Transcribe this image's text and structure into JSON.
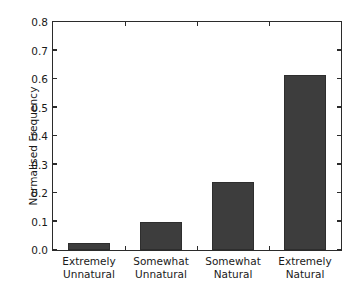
{
  "chart_data": {
    "type": "bar",
    "title": "",
    "xlabel": "",
    "ylabel": "Normalised Frequency",
    "categories": [
      "Extremely\nUnnatural",
      "Somewhat\nUnnatural",
      "Somewhat\nNatural",
      "Extremely\nNatural"
    ],
    "category_lines": [
      [
        "Extremely",
        "Unnatural"
      ],
      [
        "Somewhat",
        "Unnatural"
      ],
      [
        "Somewhat",
        "Natural"
      ],
      [
        "Extremely",
        "Natural"
      ]
    ],
    "values": [
      0.025,
      0.1,
      0.24,
      0.615
    ],
    "ylim": [
      0.0,
      0.8
    ],
    "xlim": [
      0,
      4
    ],
    "ytick_labels": [
      "0.0",
      "0.1",
      "0.2",
      "0.3",
      "0.4",
      "0.5",
      "0.6",
      "0.7",
      "0.8"
    ],
    "ytick_values": [
      0.0,
      0.1,
      0.2,
      0.3,
      0.4,
      0.5,
      0.6,
      0.7,
      0.8
    ],
    "grid": false,
    "legend": null,
    "bar_color": "#3d3d3d",
    "axis_color": "#2b2b2b",
    "background_color": "#ffffff"
  }
}
